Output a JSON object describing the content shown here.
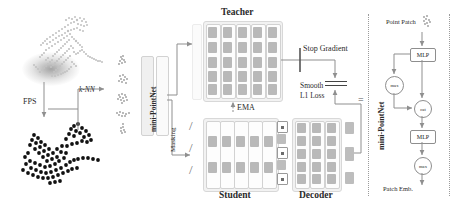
{
  "figure": {
    "labels": {
      "fps": "FPS",
      "knn": "k-NN",
      "mini_pointnet_left": "mini-PointNet",
      "masking": "Masking",
      "teacher": "Teacher",
      "student": "Student",
      "decoder": "Decoder",
      "ema": "EMA",
      "stop_gradient": "Stop Gradient",
      "smooth_l1_line1": "Smooth",
      "smooth_l1_line2": "L1 Loss",
      "mini_pointnet_right": "mini-PointNet",
      "point_patch": "Point Patch",
      "patch_emb": "Patch Emb.",
      "equals": "="
    },
    "right_panel": {
      "nodes": [
        {
          "id": "mlp-1",
          "label": "MLP",
          "shape": "box"
        },
        {
          "id": "max-1",
          "label": "max",
          "shape": "circle"
        },
        {
          "id": "cat",
          "label": "cat",
          "shape": "circle"
        },
        {
          "id": "mlp-2",
          "label": "MLP",
          "shape": "box"
        },
        {
          "id": "max-2",
          "label": "max",
          "shape": "circle"
        }
      ]
    },
    "colors": {
      "cell_gray": "#b9b9b9",
      "panel_bg": "#f2f2f2",
      "panel_border": "#d8d8d8",
      "line": "#8f8f8f",
      "text": "#2a2a2a",
      "dot": "#111111",
      "cloud_gray": "#c9c9c9",
      "background": "#ffffff"
    },
    "blocks": {
      "teacher": {
        "rows": 5,
        "cols": 5
      },
      "student": {
        "rows": 5,
        "cols": 5
      },
      "decoder": {
        "rows": 5,
        "cols": 3
      },
      "mask_tokens": 5
    }
  }
}
